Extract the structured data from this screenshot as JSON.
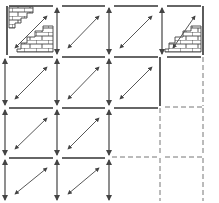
{
  "diagram": {
    "type": "tile-grid",
    "rows": 4,
    "cols": 4,
    "colors": {
      "line": "#333333",
      "dashed": "#777777",
      "arrow": "#444444",
      "brick": "#444444",
      "background": "#ffffff"
    },
    "col_x": [
      9,
      61,
      113,
      166,
      209
    ],
    "row_y": [
      6,
      57,
      108,
      158,
      203
    ],
    "cells": [
      {
        "r": 0,
        "c": 0,
        "top": "solid",
        "left": "solid",
        "right": "none",
        "bottom": "none",
        "diag": true,
        "vArrow": false,
        "brick": [
          "top-left",
          "bottom-right"
        ]
      },
      {
        "r": 0,
        "c": 1,
        "top": "solid",
        "left": "none",
        "right": "none",
        "bottom": "none",
        "diag": true,
        "vArrow": true,
        "brick": []
      },
      {
        "r": 0,
        "c": 2,
        "top": "solid",
        "left": "none",
        "right": "none",
        "bottom": "none",
        "diag": true,
        "vArrow": true,
        "brick": []
      },
      {
        "r": 0,
        "c": 3,
        "top": "solid",
        "left": "none",
        "right": "solid",
        "bottom": "none",
        "diag": true,
        "vArrow": true,
        "brick": [
          "bottom-right"
        ]
      },
      {
        "r": 1,
        "c": 0,
        "top": "solid",
        "left": "none",
        "right": "none",
        "bottom": "none",
        "diag": true,
        "vArrow": true,
        "brick": []
      },
      {
        "r": 1,
        "c": 1,
        "top": "solid",
        "left": "none",
        "right": "none",
        "bottom": "none",
        "diag": true,
        "vArrow": true,
        "brick": []
      },
      {
        "r": 1,
        "c": 2,
        "top": "solid",
        "left": "none",
        "right": "solid",
        "bottom": "none",
        "diag": true,
        "vArrow": true,
        "brick": []
      },
      {
        "r": 1,
        "c": 3,
        "top": "solid",
        "left": "none",
        "right": "dashed",
        "bottom": "dashed",
        "diag": false,
        "vArrow": false,
        "brick": []
      },
      {
        "r": 2,
        "c": 0,
        "top": "solid",
        "left": "none",
        "right": "none",
        "bottom": "none",
        "diag": true,
        "vArrow": true,
        "brick": []
      },
      {
        "r": 2,
        "c": 1,
        "top": "solid",
        "left": "none",
        "right": "none",
        "bottom": "none",
        "diag": true,
        "vArrow": true,
        "brick": []
      },
      {
        "r": 2,
        "c": 2,
        "top": "solid",
        "left": "none",
        "right": "dashed",
        "bottom": "dashed",
        "diag": false,
        "vArrow": true,
        "brick": []
      },
      {
        "r": 2,
        "c": 3,
        "top": "none",
        "left": "none",
        "right": "dashed",
        "bottom": "dashed",
        "diag": false,
        "vArrow": false,
        "brick": []
      },
      {
        "r": 3,
        "c": 0,
        "top": "solid",
        "left": "none",
        "right": "none",
        "bottom": "none",
        "diag": true,
        "vArrow": true,
        "brick": []
      },
      {
        "r": 3,
        "c": 1,
        "top": "solid",
        "left": "none",
        "right": "none",
        "bottom": "none",
        "diag": true,
        "vArrow": true,
        "brick": []
      },
      {
        "r": 3,
        "c": 2,
        "top": "none",
        "left": "none",
        "right": "dashed",
        "bottom": "none",
        "diag": false,
        "vArrow": true,
        "brick": []
      },
      {
        "r": 3,
        "c": 3,
        "top": "none",
        "left": "none",
        "right": "dashed",
        "bottom": "none",
        "diag": false,
        "vArrow": false,
        "brick": []
      }
    ],
    "icons": {
      "diagonal_arrow": "double-headed-diagonal-arrow-icon",
      "vertical_arrow": "double-headed-vertical-arrow-icon",
      "brick": "brick-hatch-pattern"
    }
  }
}
